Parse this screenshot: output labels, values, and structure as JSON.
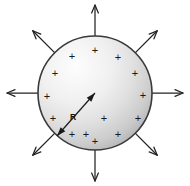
{
  "figure": {
    "background_color": "#ffffff"
  },
  "sphere": {
    "label": "charged-sphere",
    "center_x": 95,
    "center_y": 93,
    "radius": 57,
    "outline_color": "#3a3a3a",
    "fill_light": "#fdfdfd",
    "fill_mid": "#e2e2e2",
    "fill_dark": "#b4b4b4"
  },
  "radius_indicator": {
    "label": "R",
    "label_x": 73,
    "label_y": 117,
    "from_x": 95,
    "from_y": 93,
    "to_x": 57,
    "to_y": 136,
    "color": "#1a1a1a"
  },
  "charges": {
    "symbol": "+",
    "color": "#1a1a1a",
    "count": 16,
    "positions": [
      {
        "x": 95,
        "y": 50
      },
      {
        "x": 72,
        "y": 56
      },
      {
        "x": 118,
        "y": 57
      },
      {
        "x": 55,
        "y": 73
      },
      {
        "x": 135,
        "y": 73
      },
      {
        "x": 47,
        "y": 96
      },
      {
        "x": 143,
        "y": 95
      },
      {
        "x": 53,
        "y": 118
      },
      {
        "x": 138,
        "y": 118
      },
      {
        "x": 72,
        "y": 134
      },
      {
        "x": 118,
        "y": 134
      },
      {
        "x": 95,
        "y": 141
      },
      {
        "x": 104,
        "y": 118
      },
      {
        "x": 86,
        "y": 134
      }
    ]
  },
  "field_arrows": {
    "label": "radial-electric-field",
    "color": "#222222",
    "count": 8,
    "directions": [
      {
        "name": "north",
        "angle_deg": 270
      },
      {
        "name": "northeast",
        "angle_deg": 315
      },
      {
        "name": "east",
        "angle_deg": 0
      },
      {
        "name": "southeast",
        "angle_deg": 45
      },
      {
        "name": "south",
        "angle_deg": 90
      },
      {
        "name": "southwest",
        "angle_deg": 135
      },
      {
        "name": "west",
        "angle_deg": 180
      },
      {
        "name": "northwest",
        "angle_deg": 225
      }
    ],
    "inner_radius": 57,
    "outer_radius": 88
  }
}
